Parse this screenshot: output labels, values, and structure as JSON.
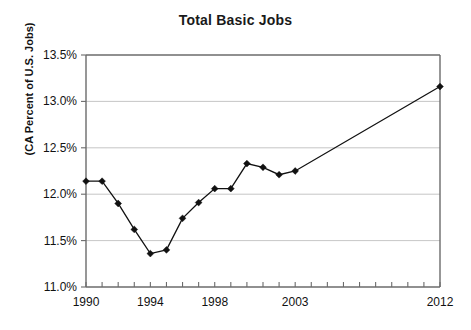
{
  "chart_data": {
    "type": "line",
    "title": "Total Basic Jobs",
    "xlabel": "",
    "ylabel": "(CA Percent of U.S. Jobs)",
    "ylim": [
      11.0,
      13.5
    ],
    "xlim": [
      1990,
      2012
    ],
    "grid": true,
    "legend": "none",
    "y_tick_labels": [
      "13.5%",
      "13.0%",
      "12.5%",
      "12.0%",
      "11.5%",
      "11.0%"
    ],
    "y_tick_values": [
      13.5,
      13.0,
      12.5,
      12.0,
      11.5,
      11.0
    ],
    "x_tick_labels": [
      "1990",
      "1994",
      "1998",
      "2003",
      "2012"
    ],
    "x_tick_values": [
      1990,
      1994,
      1998,
      2003,
      2012
    ],
    "x_minor_ticks": [
      1990,
      1991,
      1992,
      1993,
      1994,
      1995,
      1996,
      1997,
      1998,
      1999,
      2000,
      2001,
      2002,
      2003,
      2004,
      2005,
      2006,
      2007,
      2008,
      2009,
      2010,
      2011,
      2012
    ],
    "series": [
      {
        "name": "CA Percent of U.S. Jobs",
        "marker": "diamond",
        "color": "#111111",
        "x": [
          1990,
          1991,
          1992,
          1993,
          1994,
          1995,
          1996,
          1997,
          1998,
          1999,
          2000,
          2001,
          2002,
          2003,
          2012
        ],
        "values": [
          12.14,
          12.14,
          11.9,
          11.62,
          11.36,
          11.4,
          11.74,
          11.91,
          12.06,
          12.06,
          12.33,
          12.29,
          12.21,
          12.25,
          13.16
        ]
      }
    ]
  },
  "axes": {
    "plot_left": 86,
    "plot_right": 440,
    "plot_top": 55,
    "plot_bottom": 287
  }
}
